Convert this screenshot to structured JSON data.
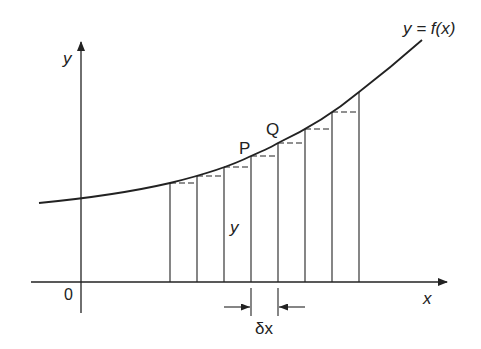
{
  "diagram": {
    "curve_label": "y = f(x)",
    "axis_x_label": "x",
    "axis_y_label": "y",
    "origin_label": "0",
    "point_p_label": "P",
    "point_q_label": "Q",
    "strip_height_label": "y",
    "strip_width_label": "δx",
    "strip_count": 7,
    "colors": {
      "line": "#222222",
      "background": "#ffffff"
    }
  }
}
